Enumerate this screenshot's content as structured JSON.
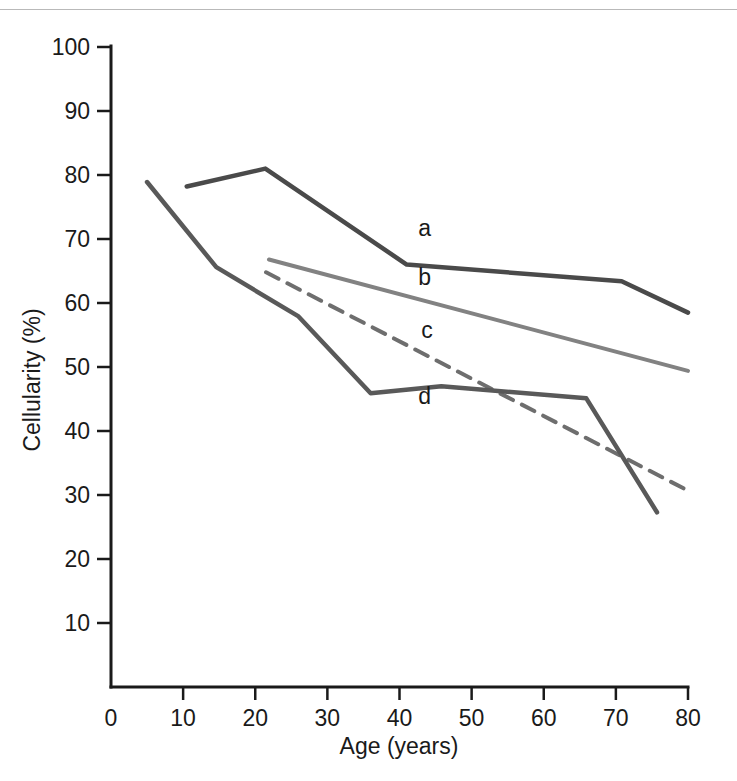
{
  "figure": {
    "background": "#ffffff",
    "top_rule_color": "#b9b9b9"
  },
  "chart_data": {
    "type": "line",
    "title": "",
    "xlabel": "Age (years)",
    "ylabel": "Cellularity (%)",
    "xlim": [
      0,
      80
    ],
    "ylim": [
      0,
      100
    ],
    "xticks": [
      0,
      10,
      20,
      30,
      40,
      50,
      60,
      70,
      80
    ],
    "xtick_labels": [
      "0",
      "10",
      "20",
      "30",
      "40",
      "50",
      "60",
      "70",
      "80"
    ],
    "yticks": [
      10,
      20,
      30,
      40,
      50,
      60,
      70,
      80,
      90,
      100
    ],
    "ytick_labels": [
      "10",
      "20",
      "30",
      "40",
      "50",
      "60",
      "70",
      "80",
      "90",
      "100"
    ],
    "grid": false,
    "legend_position": "inline-labels",
    "series": [
      {
        "name": "a",
        "label": "a",
        "style": "solid",
        "color": "#4a4a4a",
        "width": 4.5,
        "label_x": 43.5,
        "label_y": 70.5,
        "x": [
          10.5,
          21.4,
          41.0,
          70.8,
          80.0
        ],
        "y": [
          78.2,
          81.0,
          66.0,
          63.4,
          58.5
        ]
      },
      {
        "name": "b",
        "label": "b",
        "style": "solid",
        "color": "#828282",
        "width": 4.0,
        "label_x": 43.5,
        "label_y": 62.8,
        "x": [
          21.9,
          80.0
        ],
        "y": [
          66.8,
          49.4
        ]
      },
      {
        "name": "c",
        "label": "c",
        "style": "dashed",
        "color": "#6e6e6e",
        "width": 4.0,
        "label_x": 43.8,
        "label_y": 54.5,
        "x": [
          21.5,
          79.8
        ],
        "y": [
          64.8,
          30.8
        ]
      },
      {
        "name": "d",
        "label": "d",
        "style": "solid",
        "color": "#595959",
        "width": 4.5,
        "label_x": 43.5,
        "label_y": 44.2,
        "x": [
          5.0,
          14.6,
          26.0,
          36.0,
          45.8,
          65.9,
          75.7
        ],
        "y": [
          78.9,
          65.6,
          57.9,
          45.9,
          47.0,
          45.1,
          27.3
        ]
      }
    ]
  }
}
